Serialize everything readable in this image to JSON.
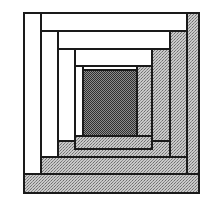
{
  "figure": {
    "canvas": {
      "width": 215,
      "height": 213
    },
    "background_color": "#ffffff"
  },
  "palette": {
    "light_fabric": "#ffffff",
    "dark_fabric_stipple": "#b6b6b6",
    "center_fabric": "#6e6e6e",
    "seam_line": "#1a1a1a",
    "page_background": "#ffffff"
  },
  "block": {
    "name": "log-cabin-block",
    "bounds": {
      "x": 24,
      "y": 13,
      "width": 175,
      "height": 180
    },
    "rounds": 4,
    "center": {
      "name": "center-square",
      "fabric": "center",
      "x": 83,
      "y": 70,
      "width": 54,
      "height": 66
    },
    "logs": [
      {
        "name": "log-round4-top",
        "round": 4,
        "fabric": "light",
        "x": 24,
        "y": 13,
        "width": 163,
        "height": 18
      },
      {
        "name": "log-round4-left",
        "round": 4,
        "fabric": "light",
        "x": 24,
        "y": 13,
        "width": 17,
        "height": 161
      },
      {
        "name": "log-round4-right",
        "round": 4,
        "fabric": "dark",
        "x": 187,
        "y": 13,
        "width": 12,
        "height": 180
      },
      {
        "name": "log-round4-bottom",
        "round": 4,
        "fabric": "dark",
        "x": 24,
        "y": 174,
        "width": 175,
        "height": 19
      },
      {
        "name": "log-round3-top",
        "round": 3,
        "fabric": "light",
        "x": 41,
        "y": 31,
        "width": 129,
        "height": 18
      },
      {
        "name": "log-round3-left",
        "round": 3,
        "fabric": "light",
        "x": 41,
        "y": 31,
        "width": 17,
        "height": 126
      },
      {
        "name": "log-round3-right",
        "round": 3,
        "fabric": "dark",
        "x": 170,
        "y": 31,
        "width": 17,
        "height": 143
      },
      {
        "name": "log-round3-bottom",
        "round": 3,
        "fabric": "dark",
        "x": 41,
        "y": 157,
        "width": 146,
        "height": 17
      },
      {
        "name": "log-round2-top",
        "round": 2,
        "fabric": "light",
        "x": 58,
        "y": 49,
        "width": 94,
        "height": 17
      },
      {
        "name": "log-round2-left",
        "round": 2,
        "fabric": "light",
        "x": 58,
        "y": 49,
        "width": 17,
        "height": 92
      },
      {
        "name": "log-round2-right",
        "round": 2,
        "fabric": "dark",
        "x": 152,
        "y": 49,
        "width": 18,
        "height": 108
      },
      {
        "name": "log-round2-bottom",
        "round": 2,
        "fabric": "dark",
        "x": 58,
        "y": 141,
        "width": 112,
        "height": 16
      },
      {
        "name": "log-round1-top",
        "round": 1,
        "fabric": "light",
        "x": 75,
        "y": 66,
        "width": 62,
        "height": 15
      },
      {
        "name": "log-round1-left",
        "round": 1,
        "fabric": "light",
        "x": 75,
        "y": 66,
        "width": 8,
        "height": 75
      },
      {
        "name": "log-round1-right",
        "round": 1,
        "fabric": "dark",
        "x": 137,
        "y": 66,
        "width": 15,
        "height": 75
      },
      {
        "name": "log-round1-bottom",
        "round": 1,
        "fabric": "dark",
        "x": 75,
        "y": 136,
        "width": 77,
        "height": 13
      }
    ]
  }
}
